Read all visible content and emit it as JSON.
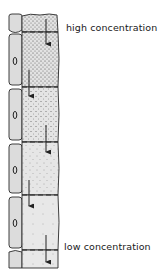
{
  "labels": {
    "top": "high concentration",
    "bottom": "low concentration"
  },
  "diagram": {
    "cell_count": 4,
    "flow_direction": "downward",
    "arrow_count": 5,
    "colors": {
      "outline": "#2a2a2a",
      "companion_fill": "#dcdcdc",
      "tube_fill": "#e4e4e4",
      "stipple": "#555555"
    }
  }
}
